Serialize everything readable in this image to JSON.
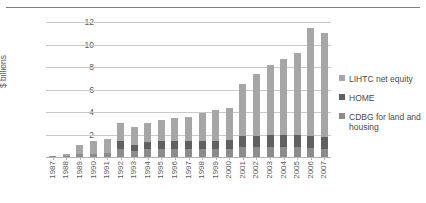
{
  "chart_data": {
    "type": "bar",
    "stacked": true,
    "title": "",
    "xlabel": "",
    "ylabel": "$ billions",
    "ylim": [
      0,
      12
    ],
    "yticks": [
      2,
      4,
      6,
      8,
      10,
      12
    ],
    "grid": true,
    "legend_position": "right",
    "categories": [
      "1987",
      "1988",
      "1989",
      "1990",
      "1991",
      "1992",
      "1993",
      "1994",
      "1995",
      "1996",
      "1997",
      "1998",
      "1999",
      "2000",
      "2001",
      "2002",
      "2003",
      "2004",
      "2005",
      "2006",
      "2007"
    ],
    "series": [
      {
        "name": "CDBG for land and housing",
        "color": "#8c8c8c",
        "values": [
          0.05,
          0.1,
          0.25,
          0.3,
          0.35,
          0.7,
          0.55,
          0.7,
          0.75,
          0.75,
          0.7,
          0.7,
          0.7,
          0.7,
          0.85,
          0.85,
          0.85,
          0.85,
          0.85,
          0.8,
          0.75
        ]
      },
      {
        "name": "HOME",
        "color": "#606060",
        "values": [
          0.0,
          0.0,
          0.0,
          0.0,
          0.0,
          0.75,
          0.55,
          0.6,
          0.65,
          0.7,
          0.7,
          0.7,
          0.75,
          0.8,
          1.05,
          1.05,
          1.1,
          1.15,
          1.1,
          1.1,
          1.05
        ]
      },
      {
        "name": "LIHTC net equity",
        "color": "#a6a6a6",
        "values": [
          0.05,
          0.15,
          0.85,
          1.1,
          1.25,
          1.6,
          1.6,
          1.7,
          1.85,
          2.05,
          2.15,
          2.55,
          2.75,
          2.9,
          4.55,
          5.5,
          6.25,
          6.75,
          7.3,
          9.55,
          9.25
        ]
      }
    ],
    "legend": [
      {
        "label": "LIHTC net equity",
        "color": "#a6a6a6"
      },
      {
        "label": "HOME",
        "color": "#606060"
      },
      {
        "label": "CDBG for land and housing",
        "color": "#8c8c8c"
      }
    ]
  }
}
